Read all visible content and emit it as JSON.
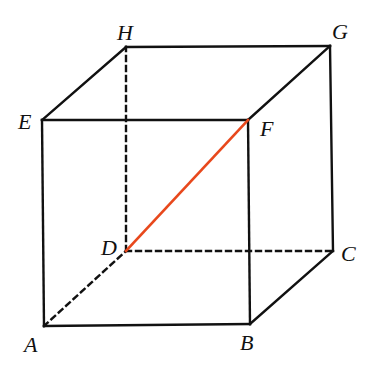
{
  "diagram": {
    "vertices": {
      "A": {
        "x": 44,
        "y": 326,
        "lx": 24,
        "ly": 334
      },
      "B": {
        "x": 250,
        "y": 324,
        "lx": 240,
        "ly": 332
      },
      "C": {
        "x": 333,
        "y": 251,
        "lx": 341,
        "ly": 243
      },
      "D": {
        "x": 126,
        "y": 251,
        "lx": 101,
        "ly": 237
      },
      "E": {
        "x": 42,
        "y": 120,
        "lx": 18,
        "ly": 111
      },
      "F": {
        "x": 248,
        "y": 120,
        "lx": 260,
        "ly": 118
      },
      "G": {
        "x": 330,
        "y": 46,
        "lx": 332,
        "ly": 21
      },
      "H": {
        "x": 126,
        "y": 47,
        "lx": 117,
        "ly": 22
      }
    },
    "labels": {
      "A": "A",
      "B": "B",
      "C": "C",
      "D": "D",
      "E": "E",
      "F": "F",
      "G": "G",
      "H": "H"
    },
    "solid_edges": [
      [
        "A",
        "B"
      ],
      [
        "B",
        "C"
      ],
      [
        "C",
        "G"
      ],
      [
        "G",
        "H"
      ],
      [
        "H",
        "E"
      ],
      [
        "E",
        "A"
      ],
      [
        "E",
        "F"
      ],
      [
        "F",
        "G"
      ],
      [
        "F",
        "B"
      ]
    ],
    "dashed_edges": [
      [
        "A",
        "D"
      ],
      [
        "D",
        "C"
      ],
      [
        "D",
        "H"
      ]
    ],
    "highlight_edges": [
      [
        "D",
        "F"
      ]
    ],
    "colors": {
      "edge": "#111111",
      "highlight": "#e8481c"
    }
  }
}
